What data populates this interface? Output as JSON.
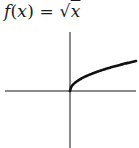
{
  "chart_data": {
    "type": "line",
    "title": "f(x) = √x",
    "function": "sqrt(x)",
    "xlabel": "",
    "ylabel": "",
    "grid": false,
    "legend": null,
    "axes": {
      "x_axis": true,
      "y_axis": true,
      "ticks": false,
      "tick_labels": false
    },
    "series": [
      {
        "name": "f(x) = √x",
        "x": [
          0,
          1,
          2,
          3,
          4,
          5,
          6,
          7,
          8,
          9
        ],
        "values": [
          0,
          1,
          1.414,
          1.732,
          2,
          2.236,
          2.449,
          2.646,
          2.828,
          3
        ]
      }
    ],
    "domain_visible": "x ≥ 0",
    "colors": {
      "curve": "#111111",
      "axes": "#8a8a8a"
    }
  },
  "title": {
    "f": "f",
    "open": "(",
    "x": "x",
    "close": ") = √",
    "x2": "x"
  }
}
